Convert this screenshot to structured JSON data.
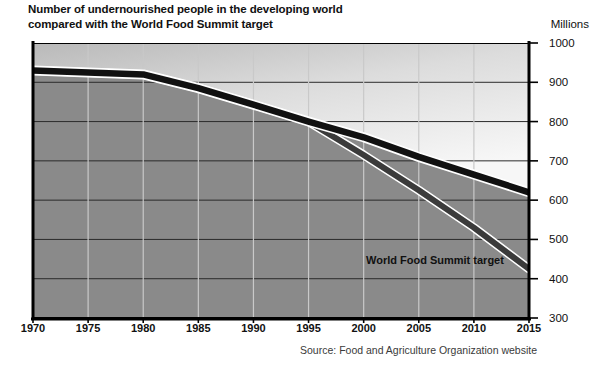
{
  "title": {
    "line1": "Number of undernourished people in the developing world",
    "line2": "compared with the World Food Summit target"
  },
  "unit_label": "Millions",
  "source_note": "Source: Food and Agriculture Organization website",
  "annotation_label": "World Food Summit target",
  "colors": {
    "actual_line": "#111111",
    "target_line": "#3b3b3b",
    "line_highlight": "#ffffff",
    "plot_fill": "#8a8a8a",
    "upper_fill_light": "#f4f4f4",
    "upper_fill_dark": "#b9b9b9",
    "gridline_horizontal": "#2b2b2b",
    "gridline_vertical": "#c9c9c9",
    "axis": "#000000",
    "text": "#111111",
    "source_text": "#3a3a3a"
  },
  "chart_data": {
    "type": "line",
    "title": "Number of undernourished people in the developing world compared with the World Food Summit target",
    "xlabel": "",
    "ylabel": "Millions",
    "xlim": [
      1970,
      2015
    ],
    "ylim": [
      300,
      1000
    ],
    "x_ticks": [
      1970,
      1975,
      1980,
      1985,
      1990,
      1995,
      2000,
      2005,
      2010,
      2015
    ],
    "y_ticks": [
      300,
      400,
      500,
      600,
      700,
      800,
      900,
      1000
    ],
    "grid": true,
    "legend": "annotation-inline",
    "annotations": [
      {
        "text": "World Food Summit target",
        "x": 2004,
        "y": 430
      }
    ],
    "x": [
      1970,
      1975,
      1980,
      1985,
      1990,
      1995,
      2000,
      2005,
      2010,
      2015
    ],
    "series": [
      {
        "name": "Number of undernourished people",
        "values": [
          930,
          925,
          920,
          885,
          843,
          800,
          760,
          710,
          665,
          620
        ]
      },
      {
        "name": "World Food Summit target",
        "values": [
          930,
          925,
          920,
          885,
          843,
          800,
          715,
          625,
          530,
          425
        ]
      }
    ]
  }
}
